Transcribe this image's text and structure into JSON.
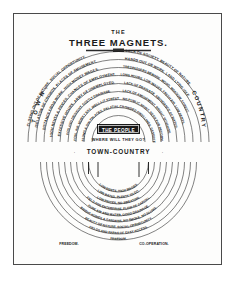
{
  "document": {
    "title_line1": "THE",
    "title_line2": "THREE MAGNETS."
  },
  "poles": {
    "left": "T O W N .",
    "right": "COUNTRY.",
    "center": "TOWN-COUNTRY"
  },
  "people_magnet": {
    "label": "THE PEOPLE",
    "question": "WHERE WILL THEY GO?"
  },
  "town_magnet": {
    "name": "TOWN",
    "lines": [
      "CLOSING OUT OF NATURE. SOCIAL OPPORTUNITY.",
      "ISOLATION OF CROWDS. PLACES OF AMUSEMENT.",
      "DISTANCE FROM WORK. HIGH MONEY WAGES.",
      "HIGH RENTS & PRICES. CHANCES OF EMPLOYMENT.",
      "EXCESSIVE HOURS. ARMY OF UNEMPLOYED.",
      "FOG AND DROUGHT. COSTLY DRAINAGE.",
      "FOUL AIR. MURKY SKY. WELL-LIT STREETS.",
      "SLUMS & GIN PALACES. PALATIAL EDIFICES."
    ]
  },
  "country_magnet": {
    "name": "COUNTRY",
    "lines": [
      "LACK OF SOCIETY. BEAUTY OF NATURE.",
      "HANDS OUT OF WORK. LAND LYING IDLE.",
      "TRESPASSERS BEWARE. WOOD, MEADOW, FOREST.",
      "LONG HOURS, LOW WAGES. FRESH AIR. LOW RENTS.",
      "LACK OF DRAINAGE. ABUNDANCE OF WATER.",
      "LACK OF AMUSEMENT. BRIGHT SUNSHINE.",
      "NO PUBLIC SPIRIT. NEED FOR REFORM.",
      "CROWDED DWELLINGS. DESERTED VILLAGES."
    ]
  },
  "town_country_magnet": {
    "name": "TOWN-COUNTRY",
    "lines": [
      "BEAUTY OF NATURE. SOCIAL OPPORTUNITY.",
      "FIELDS AND PARKS OF EASY ACCESS.",
      "LOW RENTS, HIGH WAGES.",
      "LOW RATES, PLENTY TO DO.",
      "LOW PRICES, NO SWEATING.",
      "FIELD FOR ENTERPRISE, FLOW OF CAPITAL.",
      "PURE AIR AND WATER, GOOD DRAINAGE.",
      "BRIGHT HOMES & GARDENS, NO SMOKE, NO SLUMS.",
      "FREEDOM.",
      "CO-OPERATION."
    ]
  },
  "colors": {
    "ink": "#1a1a1a",
    "frame": "#4a4a4a",
    "paper": "#fdfdfc"
  }
}
